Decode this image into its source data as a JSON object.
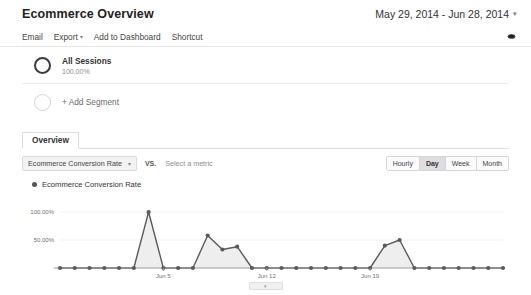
{
  "header": {
    "title": "Ecommerce Overview",
    "date_range": "May 29, 2014 - Jun 28, 2014",
    "date_caret": "▾"
  },
  "toolbar": {
    "items": [
      {
        "label": "Email",
        "caret": ""
      },
      {
        "label": "Export",
        "caret": "▾"
      },
      {
        "label": "Add to Dashboard",
        "caret": ""
      },
      {
        "label": "Shortcut",
        "caret": ""
      }
    ],
    "share_icon": "share-icon"
  },
  "segments": [
    {
      "name": "All Sessions",
      "percent": "100.00%"
    }
  ],
  "add_segment": {
    "label": "+ Add Segment"
  },
  "tabs": [
    {
      "label": "Overview",
      "active": true
    }
  ],
  "metric_row": {
    "selected_metric": "Ecommerce Conversion Rate",
    "caret": "▾",
    "vs_label": "VS.",
    "compare_placeholder": "Select a metric"
  },
  "granularity": {
    "options": [
      {
        "label": "Hourly",
        "active": false
      },
      {
        "label": "Day",
        "active": true
      },
      {
        "label": "Week",
        "active": false
      },
      {
        "label": "Month",
        "active": false
      }
    ]
  },
  "chart_legend": {
    "label": "Ecommerce Conversion Rate"
  },
  "bottom_handle": {
    "glyph": "▾"
  },
  "colors": {
    "line": "#5a5a5a",
    "fill": "#eeeeee",
    "axis": "#9a9a9a",
    "tick_text": "#6f6f6f",
    "tab_active_text": "#333333",
    "granularity_active_bg": "#dedede"
  },
  "chart_data": {
    "type": "area",
    "title": "Ecommerce Conversion Rate",
    "xlabel": "",
    "ylabel": "",
    "ylim": [
      0,
      125
    ],
    "yticks": [
      50,
      100
    ],
    "ytick_labels": [
      "50.00%",
      "100.00%"
    ],
    "grid": false,
    "legend": [
      "Ecommerce Conversion Rate"
    ],
    "legend_position": "top-left",
    "x_tick_indices": [
      7,
      14,
      21
    ],
    "x_tick_labels": [
      "Jun 5",
      "Jun 12",
      "Jun 19"
    ],
    "categories": [
      "May 29",
      "May 30",
      "May 31",
      "Jun 1",
      "Jun 2",
      "Jun 3",
      "Jun 4",
      "Jun 5",
      "Jun 6",
      "Jun 7",
      "Jun 8",
      "Jun 9",
      "Jun 10",
      "Jun 11",
      "Jun 12",
      "Jun 13",
      "Jun 14",
      "Jun 15",
      "Jun 16",
      "Jun 17",
      "Jun 18",
      "Jun 19",
      "Jun 20",
      "Jun 21",
      "Jun 22",
      "Jun 23",
      "Jun 24",
      "Jun 25",
      "Jun 26",
      "Jun 27",
      "Jun 28"
    ],
    "values": [
      0,
      0,
      0,
      0,
      0,
      0,
      100,
      0,
      0,
      0,
      58,
      33,
      38,
      0,
      0,
      0,
      0,
      0,
      0,
      0,
      0,
      0,
      40,
      50,
      0,
      0,
      0,
      0,
      0,
      0,
      0
    ],
    "series": [
      {
        "name": "Ecommerce Conversion Rate",
        "values": [
          0,
          0,
          0,
          0,
          0,
          0,
          100,
          0,
          0,
          0,
          58,
          33,
          38,
          0,
          0,
          0,
          0,
          0,
          0,
          0,
          0,
          0,
          40,
          50,
          0,
          0,
          0,
          0,
          0,
          0,
          0
        ]
      }
    ]
  }
}
